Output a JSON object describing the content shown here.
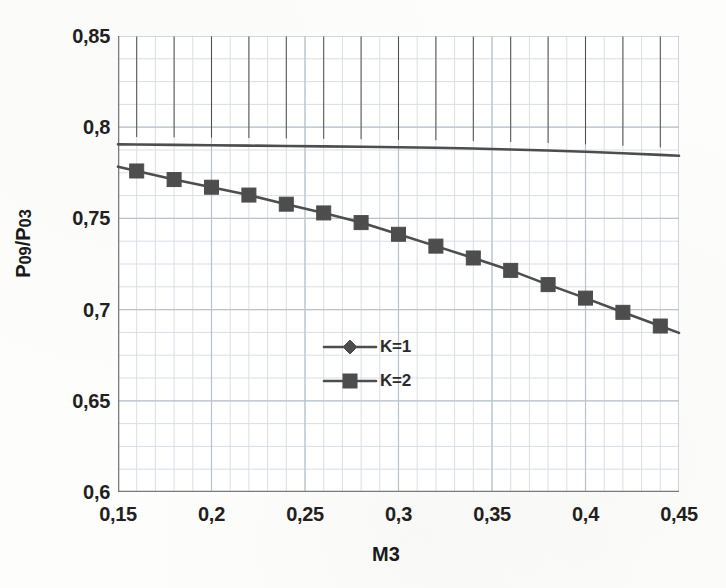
{
  "chart_data": {
    "type": "line",
    "title": "",
    "xlabel": "M3",
    "ylabel": "P09/P03",
    "ylabel_parts": {
      "p1": "P",
      "sub1": "09",
      "slash": "/",
      "p2": "P",
      "sub2": "03"
    },
    "xlim": [
      0.15,
      0.45
    ],
    "ylim": [
      0.6,
      0.85
    ],
    "xticks": [
      "0,15",
      "0,2",
      "0,25",
      "0,3",
      "0,35",
      "0,4",
      "0,45"
    ],
    "xtick_values": [
      0.15,
      0.2,
      0.25,
      0.3,
      0.35,
      0.4,
      0.45
    ],
    "yticks": [
      "0,6",
      "0,65",
      "0,7",
      "0,75",
      "0,8",
      "0,85"
    ],
    "ytick_values": [
      0.6,
      0.65,
      0.7,
      0.75,
      0.8,
      0.85
    ],
    "grid": true,
    "grid_major_x_step": 0.05,
    "grid_major_y_step": 0.05,
    "grid_minor_x_step": 0.01,
    "grid_minor_y_step": 0.0125,
    "legend_position": "center",
    "x": [
      0.16,
      0.18,
      0.2,
      0.22,
      0.24,
      0.26,
      0.28,
      0.3,
      0.32,
      0.34,
      0.36,
      0.38,
      0.4,
      0.42,
      0.44
    ],
    "series": [
      {
        "name": "K=1",
        "marker": "diamond",
        "color": "#4d4d4d",
        "values": [
          0.7905,
          0.7903,
          0.7901,
          0.7899,
          0.7897,
          0.7895,
          0.7893,
          0.789,
          0.7887,
          0.7883,
          0.7878,
          0.7872,
          0.7865,
          0.7857,
          0.7848
        ]
      },
      {
        "name": "K=2",
        "marker": "square",
        "color": "#4d4d4d",
        "values": [
          0.776,
          0.7713,
          0.7671,
          0.7628,
          0.7578,
          0.753,
          0.7477,
          0.7413,
          0.7348,
          0.7283,
          0.7215,
          0.7137,
          0.7063,
          0.6985,
          0.691
        ]
      }
    ]
  },
  "legend": {
    "items": [
      {
        "label": "K=1",
        "marker": "diamond"
      },
      {
        "label": "K=2",
        "marker": "square"
      }
    ]
  },
  "colors": {
    "series_line": "#4d4d4d",
    "axis": "#7a7a7a",
    "grid_major": "#b8c2cc",
    "grid_minor": "#d9dfe6",
    "text": "#231f20",
    "background": "#fdfdfc"
  }
}
